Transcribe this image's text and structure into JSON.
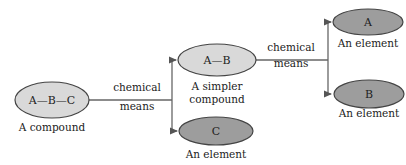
{
  "diagram": {
    "type": "flow",
    "colors": {
      "compound_fill": "#d9d9d9",
      "element_fill": "#9d9d9d",
      "stroke": "#444444",
      "line": "#555555"
    },
    "nodes": {
      "abc": {
        "formula": "A—B—C",
        "caption": "A compound"
      },
      "ab": {
        "formula": "A—B",
        "caption_line1": "A simpler",
        "caption_line2": "compound"
      },
      "c": {
        "formula": "C",
        "caption": "An element"
      },
      "a": {
        "formula": "A",
        "caption": "An element"
      },
      "b": {
        "formula": "B",
        "caption": "An element"
      }
    },
    "edges": {
      "first": {
        "label_line1": "chemical",
        "label_line2": "means"
      },
      "second": {
        "label_line1": "chemical",
        "label_line2": "means"
      }
    }
  }
}
